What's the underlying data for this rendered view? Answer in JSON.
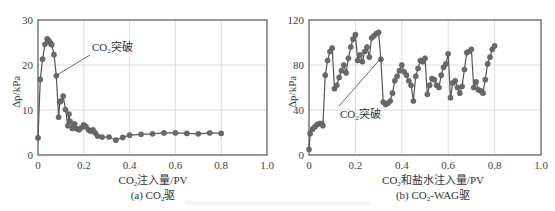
{
  "chart_data": [
    {
      "type": "line",
      "title": "(a) CO2驱",
      "caption": "(a) CO₂驱",
      "xlabel": "CO₂注入量/PV",
      "ylabel": "Δp/kPa",
      "xlim": [
        0,
        1.0
      ],
      "ylim": [
        0,
        30
      ],
      "xticks": [
        "0",
        "0.2",
        "0.4",
        "0.6",
        "0.8",
        "1.0"
      ],
      "yticks": [
        "0",
        "10",
        "20",
        "30"
      ],
      "grid": true,
      "annotation": {
        "text": "CO₂突破",
        "x": 0.08,
        "y": 17.6
      },
      "series": [
        {
          "name": "CO2驱",
          "marker": "circle",
          "color": "#666666",
          "x": [
            0,
            0.01,
            0.02,
            0.03,
            0.04,
            0.045,
            0.05,
            0.055,
            0.06,
            0.07,
            0.08,
            0.09,
            0.095,
            0.1,
            0.11,
            0.12,
            0.13,
            0.135,
            0.14,
            0.15,
            0.16,
            0.17,
            0.18,
            0.19,
            0.2,
            0.21,
            0.22,
            0.23,
            0.24,
            0.25,
            0.26,
            0.28,
            0.31,
            0.34,
            0.37,
            0.4,
            0.45,
            0.5,
            0.55,
            0.6,
            0.65,
            0.7,
            0.75,
            0.8
          ],
          "y": [
            3.8,
            16.8,
            21.3,
            24.6,
            25.8,
            25.5,
            25.2,
            24.8,
            24.5,
            22.3,
            17.6,
            8.4,
            11.8,
            12.0,
            13.1,
            10.1,
            6.5,
            9.1,
            7.5,
            5.9,
            6.9,
            5.8,
            5.6,
            6.1,
            6.7,
            6.3,
            5.6,
            5.3,
            5.6,
            4.9,
            4.2,
            4.0,
            4.0,
            3.3,
            3.9,
            4.4,
            4.6,
            4.7,
            4.9,
            4.9,
            4.8,
            4.7,
            4.9,
            4.8
          ]
        }
      ]
    },
    {
      "type": "line",
      "title": "(b) CO2-WAG驱",
      "caption": "(b) CO₂-WAG驱",
      "xlabel": "CO₂和盐水注入量/PV",
      "ylabel": "Δp/kPa",
      "xlim": [
        0,
        1.0
      ],
      "ylim": [
        0,
        120
      ],
      "xticks": [
        "0",
        "0.2",
        "0.4",
        "0.6",
        "0.8",
        "1.0"
      ],
      "yticks": [
        "0",
        "40",
        "80",
        "120"
      ],
      "grid": true,
      "annotation": {
        "text": "CO₂突破",
        "x": 0.305,
        "y": 85
      },
      "series": [
        {
          "name": "CO2-WAG驱",
          "marker": "circle",
          "color": "#666666",
          "x": [
            0,
            0.005,
            0.015,
            0.025,
            0.035,
            0.045,
            0.055,
            0.06,
            0.07,
            0.08,
            0.09,
            0.1,
            0.11,
            0.12,
            0.13,
            0.14,
            0.15,
            0.16,
            0.17,
            0.18,
            0.19,
            0.2,
            0.21,
            0.22,
            0.23,
            0.24,
            0.25,
            0.26,
            0.27,
            0.28,
            0.29,
            0.3,
            0.31,
            0.32,
            0.33,
            0.34,
            0.35,
            0.36,
            0.37,
            0.38,
            0.39,
            0.4,
            0.41,
            0.42,
            0.43,
            0.44,
            0.45,
            0.46,
            0.47,
            0.48,
            0.49,
            0.5,
            0.51,
            0.52,
            0.53,
            0.54,
            0.55,
            0.56,
            0.57,
            0.58,
            0.59,
            0.6,
            0.61,
            0.62,
            0.63,
            0.64,
            0.65,
            0.66,
            0.67,
            0.68,
            0.69,
            0.7,
            0.71,
            0.72,
            0.73,
            0.74,
            0.75,
            0.76,
            0.77,
            0.78,
            0.79,
            0.8
          ],
          "y": [
            5,
            19,
            23,
            25,
            27,
            28,
            28,
            26,
            71,
            84,
            92,
            95,
            59,
            62,
            69,
            75,
            80,
            73,
            86,
            96,
            103,
            107,
            84,
            89,
            83,
            92,
            96,
            87,
            104,
            106,
            108,
            109,
            85,
            47,
            45,
            46,
            48,
            55,
            66,
            70,
            75,
            80,
            74,
            71,
            66,
            62,
            48,
            70,
            77,
            84,
            83,
            86,
            54,
            62,
            68,
            67,
            62,
            60,
            71,
            78,
            81,
            90,
            51,
            64,
            66,
            60,
            55,
            61,
            76,
            91,
            92,
            94,
            60,
            65,
            58,
            57,
            55,
            67,
            81,
            87,
            94,
            97
          ]
        }
      ]
    }
  ]
}
